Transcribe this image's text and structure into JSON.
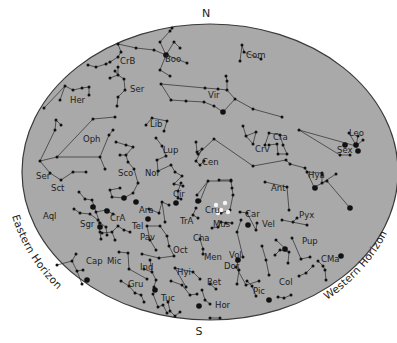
{
  "compass": {
    "north": "N",
    "south": "S"
  },
  "horizons": {
    "eastern": "Eastern Horizon",
    "western": "Western Horizon"
  },
  "colors": {
    "sky": "#a9a9a9",
    "border": "#3a3a3a",
    "lines": "#2a2a2a",
    "stars": "#111111",
    "bright_stars": "#f4f4f4",
    "background": "#ffffff"
  },
  "constellations": [
    {
      "abbr": "CrB",
      "x": 120,
      "y": 64
    },
    {
      "abbr": "Boo",
      "x": 165,
      "y": 62
    },
    {
      "abbr": "Com",
      "x": 246,
      "y": 58
    },
    {
      "abbr": "Ser",
      "x": 130,
      "y": 92
    },
    {
      "abbr": "Her",
      "x": 70,
      "y": 103
    },
    {
      "abbr": "Vir",
      "x": 208,
      "y": 98
    },
    {
      "abbr": "Lib",
      "x": 150,
      "y": 127
    },
    {
      "abbr": "Oph",
      "x": 83,
      "y": 142
    },
    {
      "abbr": "Cra",
      "x": 273,
      "y": 140
    },
    {
      "abbr": "Crv",
      "x": 255,
      "y": 152
    },
    {
      "abbr": "Leo",
      "x": 349,
      "y": 136
    },
    {
      "abbr": "Sex",
      "x": 337,
      "y": 153
    },
    {
      "abbr": "Lup",
      "x": 163,
      "y": 153
    },
    {
      "abbr": "Cen",
      "x": 202,
      "y": 165
    },
    {
      "abbr": "Hya",
      "x": 308,
      "y": 178
    },
    {
      "abbr": "Ser",
      "x": 36,
      "y": 179
    },
    {
      "abbr": "Sco",
      "x": 118,
      "y": 176
    },
    {
      "abbr": "Nor",
      "x": 145,
      "y": 176
    },
    {
      "abbr": "Sct",
      "x": 51,
      "y": 191
    },
    {
      "abbr": "Ant",
      "x": 271,
      "y": 191
    },
    {
      "abbr": "Cir",
      "x": 173,
      "y": 197
    },
    {
      "abbr": "Aql",
      "x": 43,
      "y": 219
    },
    {
      "abbr": "Ara",
      "x": 139,
      "y": 213
    },
    {
      "abbr": "Cru",
      "x": 205,
      "y": 213
    },
    {
      "abbr": "Car",
      "x": 245,
      "y": 217
    },
    {
      "abbr": "Pyx",
      "x": 299,
      "y": 218
    },
    {
      "abbr": "Sgr",
      "x": 80,
      "y": 227
    },
    {
      "abbr": "CrA",
      "x": 110,
      "y": 221
    },
    {
      "abbr": "TrA",
      "x": 180,
      "y": 224
    },
    {
      "abbr": "Tel",
      "x": 132,
      "y": 229
    },
    {
      "abbr": "Mus",
      "x": 213,
      "y": 227
    },
    {
      "abbr": "Vel",
      "x": 262,
      "y": 227
    },
    {
      "abbr": "Pav",
      "x": 140,
      "y": 240
    },
    {
      "abbr": "Cha",
      "x": 193,
      "y": 241
    },
    {
      "abbr": "Pup",
      "x": 302,
      "y": 244
    },
    {
      "abbr": "Oct",
      "x": 173,
      "y": 253
    },
    {
      "abbr": "Men",
      "x": 204,
      "y": 260
    },
    {
      "abbr": "Vol",
      "x": 229,
      "y": 258
    },
    {
      "abbr": "CMa",
      "x": 321,
      "y": 262
    },
    {
      "abbr": "Cap",
      "x": 86,
      "y": 264
    },
    {
      "abbr": "Mic",
      "x": 107,
      "y": 264
    },
    {
      "abbr": "Dor",
      "x": 224,
      "y": 269
    },
    {
      "abbr": "Ind",
      "x": 140,
      "y": 270
    },
    {
      "abbr": "Hyi",
      "x": 177,
      "y": 275
    },
    {
      "abbr": "Ret",
      "x": 207,
      "y": 285
    },
    {
      "abbr": "Col",
      "x": 279,
      "y": 285
    },
    {
      "abbr": "Gru",
      "x": 128,
      "y": 287
    },
    {
      "abbr": "Pic",
      "x": 253,
      "y": 294
    },
    {
      "abbr": "Tuc",
      "x": 161,
      "y": 301
    },
    {
      "abbr": "Hor",
      "x": 215,
      "y": 308
    }
  ],
  "lines": [
    [
      [
        118,
        44
      ],
      [
        136,
        48
      ],
      [
        154,
        50
      ],
      [
        166,
        55
      ],
      [
        174,
        42
      ],
      [
        180,
        48
      ]
    ],
    [
      [
        166,
        55
      ],
      [
        160,
        42
      ],
      [
        170,
        31
      ],
      [
        172,
        28
      ]
    ],
    [
      [
        166,
        55
      ],
      [
        160,
        70
      ],
      [
        170,
        76
      ]
    ],
    [
      [
        166,
        55
      ],
      [
        187,
        63
      ]
    ],
    [
      [
        88,
        65
      ],
      [
        96,
        67
      ],
      [
        106,
        64
      ],
      [
        110,
        62
      ],
      [
        118,
        57
      ],
      [
        121,
        52
      ],
      [
        118,
        44
      ]
    ],
    [
      [
        115,
        71
      ],
      [
        118,
        75
      ],
      [
        110,
        78
      ]
    ],
    [
      [
        118,
        67
      ],
      [
        118,
        75
      ],
      [
        124,
        79
      ],
      [
        125,
        90
      ],
      [
        118,
        97
      ],
      [
        117,
        106
      ]
    ],
    [
      [
        44,
        108
      ],
      [
        65,
        86
      ],
      [
        73,
        90
      ],
      [
        82,
        88
      ],
      [
        89,
        87
      ],
      [
        89,
        95
      ]
    ],
    [
      [
        65,
        86
      ],
      [
        60,
        100
      ]
    ],
    [
      [
        242,
        45
      ],
      [
        244,
        52
      ],
      [
        261,
        59
      ]
    ],
    [
      [
        242,
        45
      ],
      [
        240,
        61
      ]
    ],
    [
      [
        161,
        84
      ],
      [
        171,
        100
      ],
      [
        186,
        101
      ],
      [
        204,
        102
      ],
      [
        214,
        106
      ],
      [
        223,
        112
      ]
    ],
    [
      [
        161,
        84
      ],
      [
        205,
        88
      ],
      [
        218,
        89
      ],
      [
        227,
        90
      ],
      [
        227,
        81
      ],
      [
        226,
        76
      ]
    ],
    [
      [
        227,
        90
      ],
      [
        235,
        99
      ],
      [
        223,
        112
      ]
    ],
    [
      [
        235,
        99
      ],
      [
        253,
        109
      ],
      [
        282,
        117
      ]
    ],
    [
      [
        146,
        125
      ],
      [
        152,
        118
      ],
      [
        167,
        121
      ],
      [
        164,
        131
      ]
    ],
    [
      [
        40,
        161
      ],
      [
        55,
        130
      ],
      [
        56,
        120
      ],
      [
        61,
        125
      ]
    ],
    [
      [
        40,
        161
      ],
      [
        57,
        157
      ],
      [
        100,
        157
      ],
      [
        109,
        135
      ],
      [
        113,
        130
      ]
    ],
    [
      [
        57,
        157
      ],
      [
        93,
        119
      ],
      [
        115,
        117
      ]
    ],
    [
      [
        100,
        157
      ],
      [
        105,
        169
      ]
    ],
    [
      [
        40,
        161
      ],
      [
        50,
        173
      ],
      [
        61,
        180
      ],
      [
        73,
        172
      ],
      [
        86,
        172
      ]
    ],
    [
      [
        243,
        126
      ],
      [
        246,
        136
      ],
      [
        253,
        144
      ]
    ],
    [
      [
        246,
        136
      ],
      [
        256,
        132
      ],
      [
        253,
        144
      ]
    ],
    [
      [
        265,
        145
      ],
      [
        269,
        133
      ],
      [
        280,
        135
      ],
      [
        283,
        145
      ],
      [
        287,
        154
      ],
      [
        278,
        154
      ],
      [
        277,
        144
      ],
      [
        269,
        145
      ]
    ],
    [
      [
        198,
        154
      ],
      [
        214,
        139
      ],
      [
        253,
        166
      ],
      [
        286,
        160
      ],
      [
        290,
        164
      ],
      [
        305,
        168
      ],
      [
        307,
        172
      ],
      [
        314,
        187
      ],
      [
        327,
        181
      ],
      [
        350,
        208
      ]
    ],
    [
      [
        307,
        172
      ],
      [
        322,
        173
      ]
    ],
    [
      [
        322,
        175
      ],
      [
        322,
        183
      ]
    ],
    [
      [
        322,
        183
      ],
      [
        336,
        174
      ]
    ],
    [
      [
        299,
        130
      ],
      [
        340,
        155
      ],
      [
        350,
        155
      ]
    ],
    [
      [
        299,
        130
      ],
      [
        356,
        146
      ],
      [
        358,
        136
      ]
    ],
    [
      [
        356,
        146
      ],
      [
        363,
        140
      ]
    ],
    [
      [
        349,
        133
      ],
      [
        356,
        145
      ]
    ],
    [
      [
        156,
        138
      ],
      [
        162,
        146
      ],
      [
        166,
        156
      ],
      [
        157,
        160
      ],
      [
        158,
        171
      ],
      [
        171,
        165
      ],
      [
        175,
        172
      ],
      [
        182,
        176
      ],
      [
        174,
        184
      ],
      [
        183,
        186
      ]
    ],
    [
      [
        116,
        142
      ],
      [
        126,
        145
      ],
      [
        133,
        147
      ],
      [
        126,
        155
      ],
      [
        120,
        155
      ]
    ],
    [
      [
        126,
        155
      ],
      [
        128,
        162
      ],
      [
        134,
        169
      ],
      [
        138,
        183
      ],
      [
        133,
        193
      ],
      [
        124,
        198
      ],
      [
        112,
        197
      ],
      [
        110,
        190
      ],
      [
        120,
        188
      ]
    ],
    [
      [
        196,
        142
      ],
      [
        197,
        152
      ],
      [
        202,
        149
      ],
      [
        196,
        161
      ],
      [
        200,
        165
      ],
      [
        204,
        161
      ]
    ],
    [
      [
        181,
        183
      ],
      [
        178,
        191
      ],
      [
        178,
        198
      ],
      [
        181,
        199
      ]
    ],
    [
      [
        208,
        181
      ],
      [
        231,
        181
      ],
      [
        232,
        188
      ],
      [
        233,
        195
      ],
      [
        230,
        210
      ],
      [
        221,
        213
      ]
    ],
    [
      [
        208,
        181
      ],
      [
        197,
        195
      ]
    ],
    [
      [
        208,
        181
      ],
      [
        200,
        201
      ]
    ],
    [
      [
        265,
        182
      ],
      [
        287,
        187
      ],
      [
        289,
        210
      ]
    ],
    [
      [
        219,
        180
      ],
      [
        231,
        180
      ]
    ],
    [
      [
        149,
        209
      ],
      [
        159,
        213
      ],
      [
        162,
        202
      ],
      [
        169,
        205
      ]
    ],
    [
      [
        162,
        202
      ],
      [
        165,
        222
      ]
    ],
    [
      [
        196,
        208
      ],
      [
        193,
        215
      ],
      [
        198,
        218
      ]
    ],
    [
      [
        212,
        228
      ],
      [
        218,
        227
      ],
      [
        221,
        222
      ],
      [
        226,
        223
      ],
      [
        232,
        223
      ]
    ],
    [
      [
        241,
        220
      ],
      [
        237,
        232
      ],
      [
        243,
        257
      ]
    ],
    [
      [
        240,
        212
      ],
      [
        247,
        213
      ],
      [
        256,
        230
      ],
      [
        257,
        223
      ]
    ],
    [
      [
        262,
        246
      ],
      [
        266,
        260
      ],
      [
        269,
        275
      ]
    ],
    [
      [
        282,
        220
      ],
      [
        307,
        225
      ]
    ],
    [
      [
        293,
        222
      ],
      [
        297,
        218
      ]
    ],
    [
      [
        79,
        192
      ],
      [
        85,
        199
      ],
      [
        92,
        200
      ],
      [
        96,
        212
      ],
      [
        100,
        223
      ],
      [
        106,
        227
      ]
    ],
    [
      [
        96,
        212
      ],
      [
        106,
        210
      ],
      [
        113,
        214
      ]
    ],
    [
      [
        106,
        227
      ],
      [
        107,
        235
      ]
    ],
    [
      [
        74,
        209
      ],
      [
        80,
        213
      ],
      [
        90,
        214
      ],
      [
        98,
        220
      ],
      [
        100,
        232
      ],
      [
        101,
        239
      ]
    ],
    [
      [
        102,
        233
      ],
      [
        112,
        232
      ],
      [
        118,
        226
      ],
      [
        124,
        230
      ],
      [
        130,
        232
      ]
    ],
    [
      [
        112,
        232
      ],
      [
        115,
        240
      ]
    ],
    [
      [
        147,
        226
      ],
      [
        160,
        226
      ],
      [
        167,
        236
      ],
      [
        169,
        246
      ],
      [
        174,
        256
      ]
    ],
    [
      [
        147,
        226
      ],
      [
        150,
        240
      ],
      [
        156,
        250
      ]
    ],
    [
      [
        142,
        254
      ],
      [
        159,
        258
      ],
      [
        174,
        256
      ]
    ],
    [
      [
        200,
        239
      ],
      [
        203,
        249
      ],
      [
        203,
        254
      ]
    ],
    [
      [
        292,
        238
      ],
      [
        301,
        259
      ],
      [
        310,
        257
      ]
    ],
    [
      [
        276,
        240
      ],
      [
        289,
        252
      ],
      [
        288,
        263
      ]
    ],
    [
      [
        275,
        255
      ],
      [
        280,
        250
      ],
      [
        289,
        252
      ]
    ],
    [
      [
        318,
        261
      ],
      [
        323,
        266
      ],
      [
        325,
        270
      ],
      [
        326,
        280
      ]
    ],
    [
      [
        313,
        266
      ],
      [
        306,
        273
      ],
      [
        299,
        276
      ]
    ],
    [
      [
        237,
        261
      ],
      [
        239,
        270
      ],
      [
        237,
        284
      ]
    ],
    [
      [
        236,
        267
      ],
      [
        246,
        285
      ],
      [
        259,
        281
      ]
    ],
    [
      [
        57,
        265
      ],
      [
        72,
        261
      ],
      [
        77,
        271
      ],
      [
        83,
        270
      ]
    ],
    [
      [
        77,
        271
      ],
      [
        82,
        284
      ]
    ],
    [
      [
        72,
        261
      ],
      [
        76,
        254
      ]
    ],
    [
      [
        119,
        252
      ],
      [
        128,
        253
      ],
      [
        129,
        269
      ],
      [
        147,
        279
      ]
    ],
    [
      [
        144,
        269
      ],
      [
        152,
        272
      ],
      [
        156,
        280
      ],
      [
        154,
        287
      ]
    ],
    [
      [
        152,
        272
      ],
      [
        150,
        260
      ]
    ],
    [
      [
        175,
        268
      ],
      [
        193,
        272
      ],
      [
        200,
        279
      ]
    ],
    [
      [
        175,
        268
      ],
      [
        186,
        287
      ]
    ],
    [
      [
        171,
        281
      ],
      [
        182,
        285
      ],
      [
        190,
        295
      ],
      [
        197,
        294
      ]
    ],
    [
      [
        121,
        281
      ],
      [
        129,
        286
      ],
      [
        135,
        293
      ],
      [
        141,
        295
      ],
      [
        144,
        302
      ]
    ],
    [
      [
        153,
        294
      ],
      [
        158,
        307
      ],
      [
        163,
        305
      ],
      [
        167,
        313
      ]
    ],
    [
      [
        168,
        302
      ],
      [
        170,
        311
      ],
      [
        175,
        316
      ],
      [
        180,
        312
      ]
    ],
    [
      [
        202,
        290
      ],
      [
        205,
        300
      ],
      [
        210,
        304
      ]
    ],
    [
      [
        210,
        284
      ],
      [
        216,
        289
      ]
    ],
    [
      [
        247,
        281
      ],
      [
        252,
        286
      ],
      [
        256,
        296
      ]
    ],
    [
      [
        278,
        297
      ],
      [
        284,
        298
      ],
      [
        291,
        295
      ]
    ],
    [
      [
        210,
        318
      ],
      [
        220,
        318
      ]
    ]
  ],
  "stars": {
    "large": [
      [
        166,
        55
      ],
      [
        223,
        112
      ],
      [
        136,
        202
      ],
      [
        124,
        198
      ],
      [
        148,
        219
      ],
      [
        100,
        227
      ],
      [
        176,
        203
      ],
      [
        198,
        201
      ],
      [
        248,
        225
      ],
      [
        238,
        260
      ],
      [
        285,
        249
      ],
      [
        341,
        256
      ],
      [
        350,
        208
      ],
      [
        358,
        151
      ],
      [
        345,
        145
      ],
      [
        315,
        188
      ],
      [
        356,
        145
      ],
      [
        93,
        207
      ],
      [
        107,
        211
      ],
      [
        87,
        280
      ],
      [
        155,
        290
      ],
      [
        199,
        306
      ],
      [
        269,
        300
      ]
    ],
    "bright": [
      [
        216,
        205
      ],
      [
        225,
        203
      ],
      [
        218,
        213
      ],
      [
        221,
        210
      ],
      [
        228,
        212
      ]
    ]
  }
}
